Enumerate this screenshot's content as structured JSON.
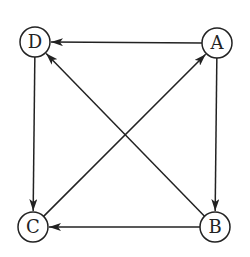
{
  "diagram": {
    "type": "directed-graph",
    "nodes": [
      {
        "id": "A",
        "label": "A",
        "x": 217,
        "y": 43
      },
      {
        "id": "B",
        "label": "B",
        "x": 215,
        "y": 227
      },
      {
        "id": "C",
        "label": "C",
        "x": 33,
        "y": 227
      },
      {
        "id": "D",
        "label": "D",
        "x": 35,
        "y": 42
      }
    ],
    "edges": [
      {
        "from": "A",
        "to": "D"
      },
      {
        "from": "A",
        "to": "B"
      },
      {
        "from": "B",
        "to": "C"
      },
      {
        "from": "B",
        "to": "D"
      },
      {
        "from": "C",
        "to": "A"
      },
      {
        "from": "D",
        "to": "C"
      }
    ],
    "colors": {
      "stroke": "#222222",
      "background": "#ffffff"
    }
  }
}
